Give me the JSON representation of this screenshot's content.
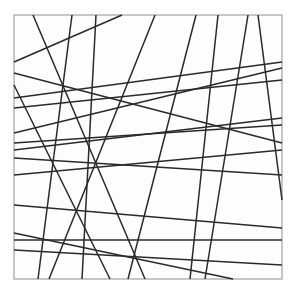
{
  "figure": {
    "type": "line-arrangement",
    "canvas": {
      "width": 296,
      "height": 292
    },
    "background_color": "#ffffff",
    "frame": {
      "x": 14,
      "y": 15,
      "width": 268,
      "height": 264,
      "fill_color": "#fdfdfd",
      "stroke_color": "#9a9a9a",
      "stroke_width": 1.1
    },
    "line_style": {
      "stroke_color": "#2a2a2a",
      "stroke_width": 1.5,
      "count": 22
    },
    "lines": [
      {
        "name": "line-1",
        "x1": 33,
        "y1": 15,
        "x2": 145,
        "y2": 279
      },
      {
        "name": "line-2",
        "x1": 14,
        "y1": 62,
        "x2": 122,
        "y2": 15
      },
      {
        "name": "line-3",
        "x1": 72,
        "y1": 15,
        "x2": 38,
        "y2": 279
      },
      {
        "name": "line-4",
        "x1": 96,
        "y1": 15,
        "x2": 82,
        "y2": 279
      },
      {
        "name": "line-5",
        "x1": 14,
        "y1": 73,
        "x2": 282,
        "y2": 143
      },
      {
        "name": "line-6",
        "x1": 14,
        "y1": 98,
        "x2": 282,
        "y2": 62
      },
      {
        "name": "line-7",
        "x1": 14,
        "y1": 108,
        "x2": 282,
        "y2": 80
      },
      {
        "name": "line-8",
        "x1": 14,
        "y1": 85,
        "x2": 110,
        "y2": 279
      },
      {
        "name": "line-9",
        "x1": 155,
        "y1": 15,
        "x2": 49,
        "y2": 279
      },
      {
        "name": "line-10",
        "x1": 14,
        "y1": 133,
        "x2": 282,
        "y2": 68
      },
      {
        "name": "line-11",
        "x1": 14,
        "y1": 143,
        "x2": 282,
        "y2": 125
      },
      {
        "name": "line-12",
        "x1": 14,
        "y1": 150,
        "x2": 282,
        "y2": 118
      },
      {
        "name": "line-13",
        "x1": 14,
        "y1": 158,
        "x2": 282,
        "y2": 175
      },
      {
        "name": "line-14",
        "x1": 14,
        "y1": 175,
        "x2": 282,
        "y2": 150
      },
      {
        "name": "line-15",
        "x1": 196,
        "y1": 15,
        "x2": 128,
        "y2": 279
      },
      {
        "name": "line-16",
        "x1": 218,
        "y1": 15,
        "x2": 190,
        "y2": 279
      },
      {
        "name": "line-17",
        "x1": 248,
        "y1": 15,
        "x2": 205,
        "y2": 279
      },
      {
        "name": "line-18",
        "x1": 258,
        "y1": 15,
        "x2": 282,
        "y2": 200
      },
      {
        "name": "line-19",
        "x1": 14,
        "y1": 205,
        "x2": 282,
        "y2": 228
      },
      {
        "name": "line-20",
        "x1": 14,
        "y1": 240,
        "x2": 282,
        "y2": 240
      },
      {
        "name": "line-21",
        "x1": 14,
        "y1": 233,
        "x2": 233,
        "y2": 279
      },
      {
        "name": "line-22",
        "x1": 14,
        "y1": 250,
        "x2": 282,
        "y2": 265
      }
    ]
  }
}
